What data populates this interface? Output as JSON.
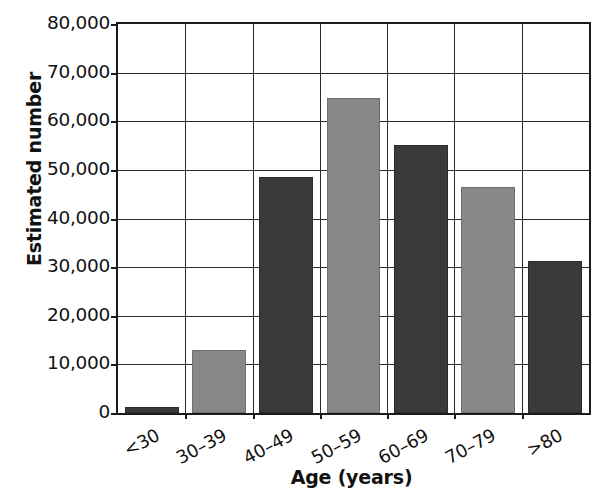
{
  "chart_data": {
    "type": "bar",
    "title": "",
    "subtitle": "",
    "xlabel": "Age (years)",
    "ylabel": "Estimated number",
    "categories": [
      "<30",
      "30–39",
      "40–49",
      "50–59",
      "60–69",
      "70–79",
      ">80"
    ],
    "values": [
      1200,
      13000,
      48500,
      64800,
      55200,
      46500,
      31200
    ],
    "bar_colors": [
      "#3a3a3a",
      "#878787",
      "#3a3a3a",
      "#878787",
      "#3a3a3a",
      "#878787",
      "#3a3a3a"
    ],
    "ylim": [
      0,
      80000
    ],
    "ytick_values": [
      0,
      10000,
      20000,
      30000,
      40000,
      50000,
      60000,
      70000,
      80000
    ],
    "ytick_labels": [
      "0",
      "10,000",
      "20,000",
      "30,000",
      "40,000",
      "50,000",
      "60,000",
      "70,000",
      "80,000"
    ],
    "grid": true,
    "grid_axis": "both",
    "legend": false,
    "legend_position": "none",
    "annotations": []
  },
  "style": {
    "dark_bar_color": "#3a3a3a",
    "light_bar_color": "#878787",
    "axis_color": "#1b1b1b",
    "grid_color": "#2a2a2a",
    "background_color": "#ffffff"
  }
}
